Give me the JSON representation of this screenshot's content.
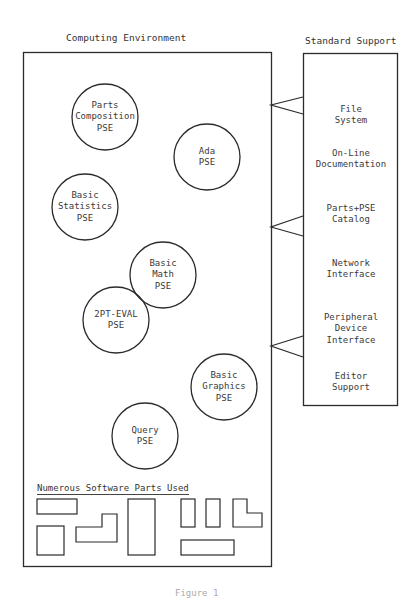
{
  "titles": {
    "computing_environment": "Computing Environment",
    "standard_support": "Standard Support"
  },
  "pse_circles": [
    {
      "label": "Parts\nComposition\nPSE",
      "lines": [
        "Parts",
        "Composition",
        "PSE"
      ],
      "cx": 105,
      "cy": 117,
      "r": 33
    },
    {
      "label": "Ada\nPSE",
      "lines": [
        "Ada",
        "PSE"
      ],
      "cx": 207,
      "cy": 157,
      "r": 33
    },
    {
      "label": "Basic\nStatistics\nPSE",
      "lines": [
        "Basic",
        "Statistics",
        "PSE"
      ],
      "cx": 85,
      "cy": 207,
      "r": 33
    },
    {
      "label": "Basic\nMath\nPSE",
      "lines": [
        "Basic",
        "Math",
        "PSE"
      ],
      "cx": 163,
      "cy": 275,
      "r": 33
    },
    {
      "label": "2PT-EVAL\nPSE",
      "lines": [
        "2PT-EVAL",
        "PSE"
      ],
      "cx": 116,
      "cy": 320,
      "r": 33
    },
    {
      "label": "Basic\nGraphics\nPSE",
      "lines": [
        "Basic",
        "Graphics",
        "PSE"
      ],
      "cx": 224,
      "cy": 387,
      "r": 33
    },
    {
      "label": "Query\nPSE",
      "lines": [
        "Query",
        "PSE"
      ],
      "cx": 145,
      "cy": 436,
      "r": 33
    }
  ],
  "standard_support_items": [
    {
      "lines": [
        "File",
        "System"
      ],
      "top": 104
    },
    {
      "lines": [
        "On-Line",
        "Documentation"
      ],
      "top": 148
    },
    {
      "lines": [
        "Parts+PSE",
        "Catalog"
      ],
      "top": 203
    },
    {
      "lines": [
        "Network",
        "Interface"
      ],
      "top": 258
    },
    {
      "lines": [
        "Peripheral",
        "Device",
        "Interface"
      ],
      "top": 312
    },
    {
      "lines": [
        "Editor",
        "Support"
      ],
      "top": 371
    }
  ],
  "parts_section": {
    "heading": "Numerous Software Parts Used"
  },
  "caption": "Figure 1",
  "colors": {
    "line": "#2b2b2b",
    "text": "#333333",
    "background": "#ffffff"
  }
}
